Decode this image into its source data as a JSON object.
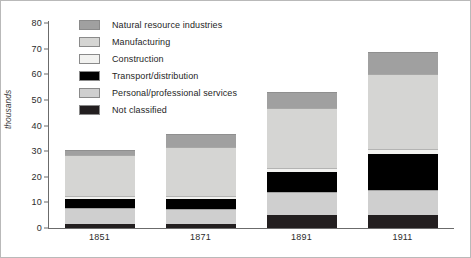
{
  "chart_data": {
    "type": "bar",
    "stacked": true,
    "title": "",
    "xlabel": "",
    "ylabel": "thousands",
    "categories": [
      "1851",
      "1871",
      "1891",
      "1911"
    ],
    "ylim": [
      0,
      80
    ],
    "yticks": [
      0,
      10,
      20,
      30,
      40,
      50,
      60,
      70,
      80
    ],
    "grid": false,
    "legend_position": "top-left-inside",
    "series": [
      {
        "name": "Not classified",
        "color": "#231f20",
        "values": [
          1.5,
          1.5,
          5.0,
          5.0
        ],
        "stack_order": 0
      },
      {
        "name": "Personal/professional services",
        "color": "#cfcfcf",
        "values": [
          6.5,
          6.0,
          9.0,
          10.0
        ],
        "stack_order": 1
      },
      {
        "name": "Transport/distribution",
        "color": "#000000",
        "values": [
          3.5,
          4.0,
          8.0,
          14.0
        ],
        "stack_order": 2
      },
      {
        "name": "Construction",
        "color": "#f2f2f0",
        "values": [
          1.0,
          1.0,
          1.5,
          2.0
        ],
        "stack_order": 3
      },
      {
        "name": "Manufacturing",
        "color": "#d5d5d3",
        "values": [
          16.0,
          19.0,
          23.5,
          29.0
        ],
        "stack_order": 4
      },
      {
        "name": "Natural resource industries",
        "color": "#a0a0a0",
        "values": [
          2.0,
          5.0,
          6.0,
          8.5
        ],
        "stack_order": 5
      }
    ],
    "totals": [
      30.5,
      36.5,
      53.0,
      68.5
    ]
  },
  "legend": {
    "items": [
      {
        "label": "Natural resource industries",
        "color": "#a0a0a0"
      },
      {
        "label": "Manufacturing",
        "color": "#d5d5d3"
      },
      {
        "label": "Construction",
        "color": "#f2f2f0"
      },
      {
        "label": "Transport/distribution",
        "color": "#000000"
      },
      {
        "label": "Personal/professional services",
        "color": "#cfcfcf"
      },
      {
        "label": "Not classified",
        "color": "#231f20"
      }
    ]
  },
  "axis": {
    "y_label": "thousands",
    "y_ticks": [
      "80",
      "70",
      "60",
      "50",
      "40",
      "30",
      "20",
      "10",
      "0"
    ],
    "x_ticks": [
      "1851",
      "1871",
      "1891",
      "1911"
    ]
  },
  "colors": {
    "frame": "#b9b9b9",
    "axis": "#6b6b6b",
    "background": "#ffffff",
    "text": "#1e1e1e"
  }
}
